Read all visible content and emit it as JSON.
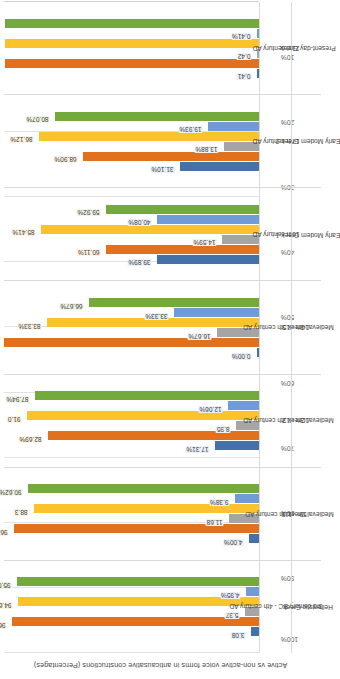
{
  "chart_data": {
    "type": "bar",
    "title": "",
    "ylabel": "Active vs non-active voice forms in anticausative constructions (Percentages)",
    "xlabel": "",
    "ylim": [
      0,
      100
    ],
    "ytick_labels": [
      "100%",
      "90%",
      "80%",
      "70%",
      "60%",
      "50%",
      "40%",
      "30%",
      "20%",
      "10%",
      "0%"
    ],
    "grid": true,
    "legend": "none",
    "orientation": "vertical-bars-rotated-page",
    "series_colors": [
      "#4472a8",
      "#e2711d",
      "#a5a5a5",
      "#fac22b",
      "#6f9bd8",
      "#74a93c"
    ],
    "categories": [
      {
        "period": "3rd century BC - 4th century AD",
        "stage": "Hellenistic Greek"
      },
      {
        "period": "5th - 11th century AD",
        "stage": "Medieval Greek 1"
      },
      {
        "period": "12th - 13th century AD",
        "stage": "Medieval Greek 2"
      },
      {
        "period": "14th - 15th century AD",
        "stage": "Medieval Greek 3"
      },
      {
        "period": "16th century AD",
        "stage": "Early Modern Greek 1"
      },
      {
        "period": "17th century AD",
        "stage": "Early Modern Greek 2"
      },
      {
        "period": "21st century AD",
        "stage": "Present-day Greek"
      }
    ],
    "groups": [
      {
        "stage": "Hellenistic Greek",
        "bars": [
          {
            "series": 0,
            "value": 3.08,
            "label": "3.08"
          },
          {
            "series": 1,
            "value": 96.9,
            "label": "96.9"
          },
          {
            "series": 2,
            "value": 5.37,
            "label": "5.37"
          },
          {
            "series": 3,
            "value": 94.6,
            "label": "94.6"
          },
          {
            "series": 4,
            "value": 4.95,
            "label": "4.95%"
          },
          {
            "series": 5,
            "value": 95.05,
            "label": "95.05%"
          }
        ]
      },
      {
        "stage": "Medieval Greek 1",
        "bars": [
          {
            "series": 0,
            "value": 4.0,
            "label": "4.00%"
          },
          {
            "series": 1,
            "value": 96.0,
            "label": "96.00%"
          },
          {
            "series": 2,
            "value": 11.68,
            "label": "11.68"
          },
          {
            "series": 3,
            "value": 88.3,
            "label": "88.3"
          },
          {
            "series": 4,
            "value": 9.38,
            "label": "9.38%"
          },
          {
            "series": 5,
            "value": 90.62,
            "label": "90.62%"
          }
        ]
      },
      {
        "stage": "Medieval Greek 2",
        "bars": [
          {
            "series": 0,
            "value": 17.31,
            "label": "17.31%"
          },
          {
            "series": 1,
            "value": 82.69,
            "label": "82.69%"
          },
          {
            "series": 2,
            "value": 8.95,
            "label": "8.95"
          },
          {
            "series": 3,
            "value": 91.0,
            "label": "91.0"
          },
          {
            "series": 4,
            "value": 12.06,
            "label": "12.06%"
          },
          {
            "series": 5,
            "value": 87.94,
            "label": "87.94%"
          }
        ]
      },
      {
        "stage": "Medieval Greek 3",
        "bars": [
          {
            "series": 0,
            "value": 0.0,
            "label": "0.00%"
          },
          {
            "series": 1,
            "value": 100.0,
            "label": "100.00%"
          },
          {
            "series": 2,
            "value": 16.67,
            "label": "16.67%"
          },
          {
            "series": 3,
            "value": 83.33,
            "label": "83.33%"
          },
          {
            "series": 4,
            "value": 33.33,
            "label": "33.33%"
          },
          {
            "series": 5,
            "value": 66.67,
            "label": "66.67%"
          }
        ]
      },
      {
        "stage": "Early Modern Greek 1",
        "bars": [
          {
            "series": 0,
            "value": 39.89,
            "label": "39.89%"
          },
          {
            "series": 1,
            "value": 60.11,
            "label": "60.11%"
          },
          {
            "series": 2,
            "value": 14.59,
            "label": "14.59%"
          },
          {
            "series": 3,
            "value": 85.41,
            "label": "85.41%"
          },
          {
            "series": 4,
            "value": 40.08,
            "label": "40.08%"
          },
          {
            "series": 5,
            "value": 59.92,
            "label": "59.92%"
          }
        ]
      },
      {
        "stage": "Early Modern Greek 2",
        "bars": [
          {
            "series": 0,
            "value": 31.1,
            "label": "31.10%"
          },
          {
            "series": 1,
            "value": 68.9,
            "label": "68.90%"
          },
          {
            "series": 2,
            "value": 13.88,
            "label": "13.88%"
          },
          {
            "series": 3,
            "value": 86.12,
            "label": "86.12%"
          },
          {
            "series": 4,
            "value": 19.93,
            "label": "19.93%"
          },
          {
            "series": 5,
            "value": 80.07,
            "label": "80.07%"
          }
        ]
      },
      {
        "stage": "Present-day Greek",
        "bars": [
          {
            "series": 0,
            "value": 0.41,
            "label": "0.41"
          },
          {
            "series": 1,
            "value": 99.5,
            "label": "99.5"
          },
          {
            "series": 2,
            "value": 0.42,
            "label": "0.42"
          },
          {
            "series": 3,
            "value": 99.5,
            "label": "99.5"
          },
          {
            "series": 4,
            "value": 0.41,
            "label": "0.41%"
          },
          {
            "series": 5,
            "value": 99.59,
            "label": "99.59%"
          }
        ]
      }
    ]
  }
}
